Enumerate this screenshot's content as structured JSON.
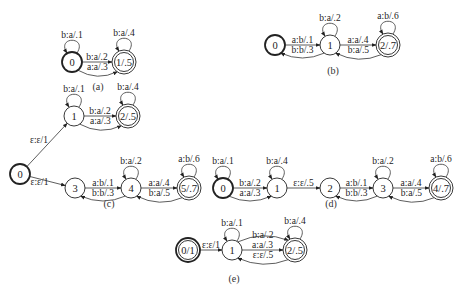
{
  "panels": [
    {
      "id": "a",
      "caption": "(a)",
      "caption_pos": [
        98,
        90
      ],
      "nodes": [
        {
          "id": "0",
          "label": "0",
          "x": 72,
          "y": 62,
          "r": 10,
          "initial": true,
          "final": false
        },
        {
          "id": "1",
          "label": "1/.5",
          "x": 124,
          "y": 62,
          "r": 12,
          "initial": false,
          "final": true
        }
      ],
      "edges": [
        {
          "from": "0",
          "to": "0",
          "label": "b:a/.1",
          "type": "loop"
        },
        {
          "from": "0",
          "to": "1",
          "label": "b:a/.2",
          "type": "straight"
        },
        {
          "from": "0",
          "to": "1",
          "label": "a:a/.3",
          "type": "curve-below"
        },
        {
          "from": "1",
          "to": "1",
          "label": "b:a/.4",
          "type": "loop"
        }
      ]
    },
    {
      "id": "b",
      "caption": "(b)",
      "caption_pos": [
        333,
        74
      ],
      "nodes": [
        {
          "id": "0",
          "label": "0",
          "x": 275,
          "y": 45,
          "r": 10,
          "initial": true,
          "final": false
        },
        {
          "id": "1",
          "label": "1",
          "x": 330,
          "y": 45,
          "r": 10,
          "initial": false,
          "final": false
        },
        {
          "id": "2",
          "label": "2/.7",
          "x": 388,
          "y": 45,
          "r": 12,
          "initial": false,
          "final": true
        }
      ],
      "edges": [
        {
          "from": "0",
          "to": "1",
          "label": "a:b/.1",
          "type": "straight"
        },
        {
          "from": "1",
          "to": "0",
          "label": "b:b/.3",
          "type": "curve-below"
        },
        {
          "from": "1",
          "to": "1",
          "label": "b:a/.2",
          "type": "loop"
        },
        {
          "from": "1",
          "to": "2",
          "label": "a:a/.4",
          "type": "straight"
        },
        {
          "from": "2",
          "to": "1",
          "label": "b:a/.5",
          "type": "curve-below"
        },
        {
          "from": "2",
          "to": "2",
          "label": "a:b/.6",
          "type": "loop"
        }
      ]
    },
    {
      "id": "c",
      "caption": "(c)",
      "caption_pos": [
        109,
        207
      ],
      "nodes": [
        {
          "id": "0",
          "label": "0",
          "x": 20,
          "y": 174,
          "r": 10,
          "initial": true,
          "final": false
        },
        {
          "id": "1",
          "label": "1",
          "x": 74,
          "y": 116,
          "r": 10,
          "initial": false,
          "final": false
        },
        {
          "id": "2",
          "label": "2/.5",
          "x": 128,
          "y": 116,
          "r": 12,
          "initial": false,
          "final": true
        },
        {
          "id": "3",
          "label": "3",
          "x": 75,
          "y": 188,
          "r": 10,
          "initial": false,
          "final": false
        },
        {
          "id": "4",
          "label": "4",
          "x": 131,
          "y": 188,
          "r": 10,
          "initial": false,
          "final": false
        },
        {
          "id": "5",
          "label": "5/.7",
          "x": 189,
          "y": 188,
          "r": 12,
          "initial": false,
          "final": true
        }
      ],
      "edges": [
        {
          "from": "0",
          "to": "1",
          "label": "ε:ε/1",
          "type": "straight"
        },
        {
          "from": "0",
          "to": "3",
          "label": "ε:ε/1",
          "type": "straight"
        },
        {
          "from": "1",
          "to": "1",
          "label": "b:a/.1",
          "type": "loop"
        },
        {
          "from": "1",
          "to": "2",
          "label": "b:a/.2",
          "type": "straight"
        },
        {
          "from": "1",
          "to": "2",
          "label": "a:a/.3",
          "type": "curve-below"
        },
        {
          "from": "2",
          "to": "2",
          "label": "b:a/.4",
          "type": "loop"
        },
        {
          "from": "3",
          "to": "4",
          "label": "a:b/.1",
          "type": "straight"
        },
        {
          "from": "4",
          "to": "3",
          "label": "b:b/.3",
          "type": "curve-below"
        },
        {
          "from": "4",
          "to": "4",
          "label": "b:a/.2",
          "type": "loop"
        },
        {
          "from": "4",
          "to": "5",
          "label": "a:a/.4",
          "type": "straight"
        },
        {
          "from": "5",
          "to": "4",
          "label": "b:a/.5",
          "type": "curve-below"
        },
        {
          "from": "5",
          "to": "5",
          "label": "a:b/.6",
          "type": "loop"
        }
      ]
    },
    {
      "id": "d",
      "caption": "(d)",
      "caption_pos": [
        331,
        207
      ],
      "nodes": [
        {
          "id": "0",
          "label": "0",
          "x": 223,
          "y": 188,
          "r": 10,
          "initial": true,
          "final": false
        },
        {
          "id": "1",
          "label": "1",
          "x": 277,
          "y": 188,
          "r": 10,
          "initial": false,
          "final": false
        },
        {
          "id": "2",
          "label": "2",
          "x": 330,
          "y": 188,
          "r": 10,
          "initial": false,
          "final": false
        },
        {
          "id": "3",
          "label": "3",
          "x": 383,
          "y": 188,
          "r": 10,
          "initial": false,
          "final": false
        },
        {
          "id": "4",
          "label": "4/.7",
          "x": 441,
          "y": 188,
          "r": 12,
          "initial": false,
          "final": true
        }
      ],
      "edges": [
        {
          "from": "0",
          "to": "0",
          "label": "b:a/.1",
          "type": "loop"
        },
        {
          "from": "0",
          "to": "1",
          "label": "b:a/.2",
          "type": "straight"
        },
        {
          "from": "0",
          "to": "1",
          "label": "a:a/.3",
          "type": "curve-below"
        },
        {
          "from": "1",
          "to": "1",
          "label": "b:a/.4",
          "type": "loop"
        },
        {
          "from": "1",
          "to": "2",
          "label": "ε:ε/.5",
          "type": "straight"
        },
        {
          "from": "2",
          "to": "3",
          "label": "a:b/.1",
          "type": "straight"
        },
        {
          "from": "3",
          "to": "2",
          "label": "b:b/.3",
          "type": "curve-below"
        },
        {
          "from": "3",
          "to": "3",
          "label": "b:a/.2",
          "type": "loop"
        },
        {
          "from": "3",
          "to": "4",
          "label": "a:a/.4",
          "type": "straight"
        },
        {
          "from": "4",
          "to": "3",
          "label": "b:a/.5",
          "type": "curve-below"
        },
        {
          "from": "4",
          "to": "4",
          "label": "a:b/.6",
          "type": "loop"
        }
      ]
    },
    {
      "id": "e",
      "caption": "(e)",
      "caption_pos": [
        234,
        282
      ],
      "nodes": [
        {
          "id": "0",
          "label": "0/1",
          "x": 188,
          "y": 250,
          "r": 12,
          "initial": true,
          "final": true
        },
        {
          "id": "1",
          "label": "1",
          "x": 232,
          "y": 250,
          "r": 10,
          "initial": false,
          "final": false
        },
        {
          "id": "2",
          "label": "2/.5",
          "x": 295,
          "y": 250,
          "r": 12,
          "initial": false,
          "final": true
        }
      ],
      "edges": [
        {
          "from": "0",
          "to": "1",
          "label": "ε:ε/1",
          "type": "straight"
        },
        {
          "from": "1",
          "to": "1",
          "label": "b:a/.1",
          "type": "loop"
        },
        {
          "from": "1",
          "to": "2",
          "label": "b:a/.2",
          "type": "curve-above"
        },
        {
          "from": "1",
          "to": "2",
          "label": "a:a/.3",
          "type": "straight"
        },
        {
          "from": "2",
          "to": "1",
          "label": "ε:ε/.5",
          "type": "curve-below"
        },
        {
          "from": "2",
          "to": "2",
          "label": "b:a/.4",
          "type": "loop"
        }
      ]
    }
  ]
}
